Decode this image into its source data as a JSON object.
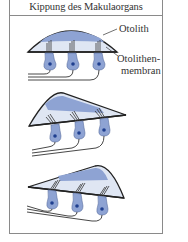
{
  "figure": {
    "title": "Kippung des Makulaorgans",
    "panels": [
      {
        "id": "upright",
        "tilt": "none"
      },
      {
        "id": "tilted-right",
        "tilt": "otolith shifted"
      },
      {
        "id": "tilted-left",
        "tilt": "otolith shifted"
      }
    ],
    "labels": {
      "otolith": "Otolith",
      "membrane_line1": "Otolithen-",
      "membrane_line2": "membran"
    }
  },
  "colors": {
    "frame": "#8a8a8a",
    "outline": "#222222",
    "otolith_band": "#8ea3d3",
    "membrane_fill": "#dfe6f3",
    "cell_fill": "#8ea3d3",
    "nucleus": "#1f3f8f",
    "nerve": "#333333"
  }
}
